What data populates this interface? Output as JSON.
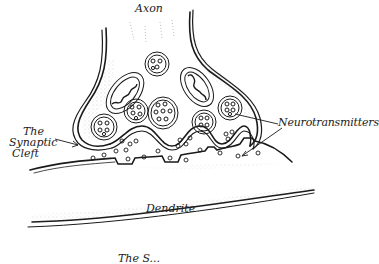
{
  "diagram": {
    "type": "hand-drawn biology illustration",
    "labels": {
      "axon": "Axon",
      "neurotransmitters": "Neurotransmitters",
      "cleft_line1": "The",
      "cleft_line2": "Synaptic",
      "cleft_line3": "Cleft",
      "dendrite": "Dendrite",
      "bottom_partial": "The S..."
    },
    "colors": {
      "ink": "#1a1a1a",
      "background": "#ffffff",
      "stipple": "#777777"
    }
  }
}
